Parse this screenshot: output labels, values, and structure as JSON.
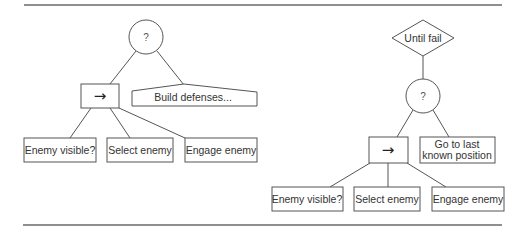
{
  "figure": {
    "left_tree": {
      "root": {
        "type": "selector",
        "symbol": "?"
      },
      "sequence": {
        "type": "sequence",
        "symbol": "→"
      },
      "fallback": {
        "type": "subtree",
        "label": "Build defenses..."
      },
      "leaves": [
        {
          "label": "Enemy visible?"
        },
        {
          "label": "Select enemy"
        },
        {
          "label": "Engage enemy"
        }
      ]
    },
    "right_tree": {
      "decorator": {
        "type": "until-fail",
        "label": "Until fail"
      },
      "selector": {
        "type": "selector",
        "symbol": "?"
      },
      "sequence": {
        "type": "sequence",
        "symbol": "→"
      },
      "fallback": {
        "type": "action",
        "label_line1": "Go to last",
        "label_line2": "known position"
      },
      "leaves": [
        {
          "label": "Enemy visible?"
        },
        {
          "label": "Select enemy"
        },
        {
          "label": "Engage enemy"
        }
      ]
    }
  },
  "colors": {
    "stroke": "#555555",
    "text": "#333333",
    "rule": "#6a6a6a",
    "background": "#ffffff"
  }
}
